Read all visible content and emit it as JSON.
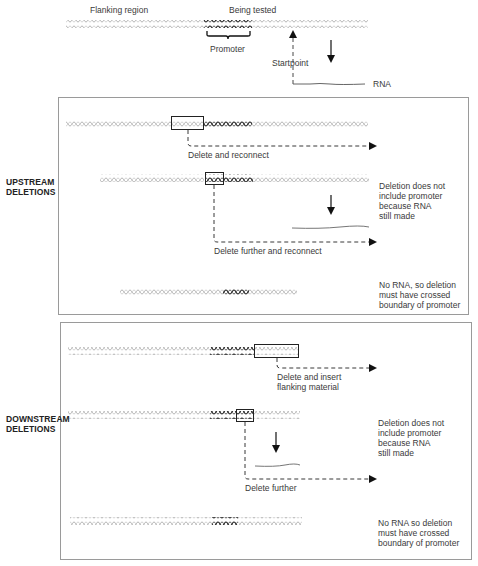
{
  "top": {
    "flanking_label": "Flanking region",
    "tested_label": "Being tested",
    "promoter_label": "Promoter",
    "startpoint_label": "Startpoint",
    "rna_label": "RNA"
  },
  "upstream": {
    "side_label_line1": "UPSTREAM",
    "side_label_line2": "DELETIONS",
    "step1_label": "Delete and reconnect",
    "step2_label": "Delete further and reconnect",
    "note1": [
      "Deletion does not",
      "include promoter",
      "because RNA",
      "still made"
    ],
    "note2": [
      "No RNA, so deletion",
      "must have crossed",
      "boundary of promoter"
    ]
  },
  "downstream": {
    "side_label_line1": "DOWNSTREAM",
    "side_label_line2": "DELETIONS",
    "step1_label_line1": "Delete and insert",
    "step1_label_line2": "flanking material",
    "step2_label": "Delete further",
    "note1": [
      "Deletion does not",
      "include promoter",
      "because RNA",
      "still made"
    ],
    "note2": [
      "No RNA so deletion",
      "must have crossed",
      "boundary of promoter"
    ]
  },
  "colors": {
    "flank_dna": "#b5b5b5",
    "promoter_dna": "#3a3a3a",
    "box_border": "#9a9a9a",
    "arrow": "#111111"
  }
}
